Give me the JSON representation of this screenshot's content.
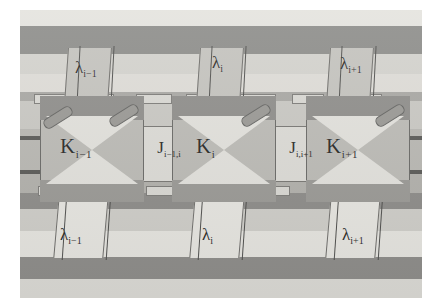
{
  "nodes": [
    {
      "id": "k-left",
      "label": "K",
      "sub": "i−1"
    },
    {
      "id": "k-center",
      "label": "K",
      "sub": "i"
    },
    {
      "id": "k-right",
      "label": "K",
      "sub": "i+1"
    }
  ],
  "couplings": [
    {
      "id": "j-left",
      "label": "J",
      "sub": "i−1,i"
    },
    {
      "id": "j-right",
      "label": "J",
      "sub": "i,i+1"
    }
  ],
  "lambdas_top": [
    {
      "id": "lambda-top-left",
      "label": "λ",
      "sub": "i−1"
    },
    {
      "id": "lambda-top-center",
      "label": "λ",
      "sub": "i"
    },
    {
      "id": "lambda-top-right",
      "label": "λ",
      "sub": "i+1"
    }
  ],
  "lambdas_bottom": [
    {
      "id": "lambda-bottom-left",
      "label": "λ",
      "sub": "i−1"
    },
    {
      "id": "lambda-bottom-center",
      "label": "λ",
      "sub": "i"
    },
    {
      "id": "lambda-bottom-right",
      "label": "λ",
      "sub": "i+1"
    }
  ],
  "colors": {
    "background": "#ffffff",
    "band_light": "#e4e3de",
    "band_dark": "#8d8d8a",
    "plate": "#c9c8c3",
    "node_face": "#e2e1dc",
    "node_shade": "#8f8e8b",
    "rod": "#9a9995",
    "outline": "#6a6a67",
    "text": "#2a2a28"
  }
}
